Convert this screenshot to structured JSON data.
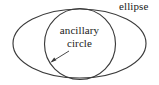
{
  "figure": {
    "type": "geometry-diagram",
    "background_color": "#ffffff",
    "stroke_color": "#3a3a3a",
    "text_color": "#1a1a1a",
    "width": 159,
    "height": 85,
    "labels": {
      "ellipse": "ellipse",
      "ancillary": "ancillary",
      "circle": "circle"
    },
    "shapes": {
      "ellipse": {
        "name": "ellipse",
        "center_x": 79.5,
        "center_y": 43.5,
        "radius_x": 66.5,
        "radius_y": 34.5
      },
      "circle": {
        "name": "ancillary circle",
        "center_x": 80,
        "center_y": 44,
        "radius": 35.5
      }
    },
    "annotation": {
      "name": "leader-arrow",
      "from_x": 69,
      "from_y": 51,
      "to_x": 50.5,
      "to_y": 62.5,
      "points_to": "ancillary circle boundary"
    }
  }
}
